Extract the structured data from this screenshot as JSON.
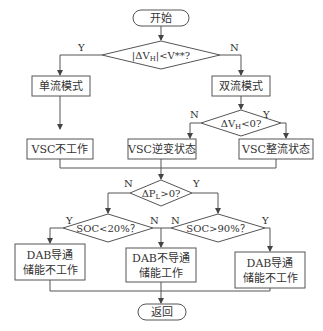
{
  "nodes": {
    "start": "开始",
    "cond1": "|ΔV",
    "cond1_sub": "H",
    "cond1_tail": "|<V**?",
    "single_mode": "单流模式",
    "dual_mode": "双流模式",
    "cond2": "ΔV",
    "cond2_sub": "H",
    "cond2_tail": "<0?",
    "vsc_off": "VSC不工作",
    "vsc_inverter": "VSC逆变状态",
    "vsc_rectifier": "VSC整流状态",
    "cond3": "ΔP",
    "cond3_sub": "L",
    "cond3_tail": ">0?",
    "cond4": "SOC<20%？",
    "cond5": "SOC>90%？",
    "dab_on_store_off_left_l1": "DAB导通",
    "dab_on_store_off_left_l2": "储能不工作",
    "dab_off_store_on_l1": "DAB不导通",
    "dab_off_store_on_l2": "储能工作",
    "dab_on_store_off_right_l1": "DAB导通",
    "dab_on_store_off_right_l2": "储能不工作",
    "return": "返回"
  },
  "labels": {
    "y": "Y",
    "n": "N"
  }
}
